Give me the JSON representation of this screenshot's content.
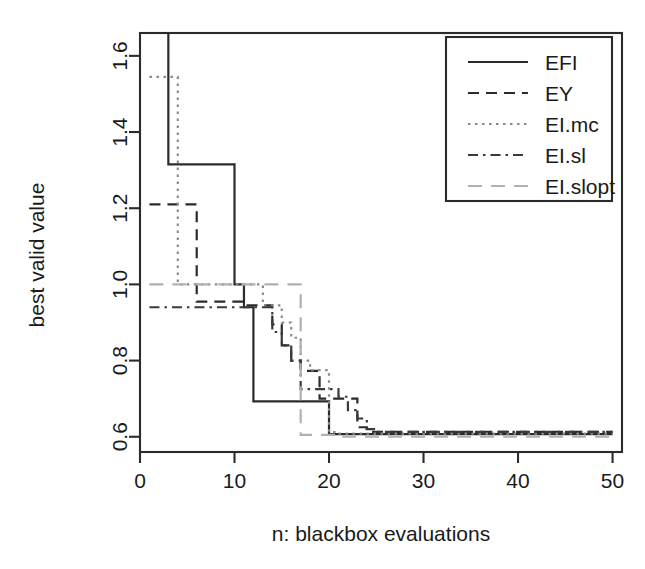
{
  "chart_data": {
    "type": "line",
    "title": "",
    "subtitle": "",
    "xlabel": "n: blackbox evaluations",
    "ylabel": "best valid value",
    "xlim": [
      0,
      51
    ],
    "ylim": [
      0.56,
      1.66
    ],
    "xticks": [
      0,
      10,
      20,
      30,
      40,
      50
    ],
    "xticklabels": [
      "0",
      "10",
      "20",
      "30",
      "40",
      "50"
    ],
    "yticks": [
      0.6,
      0.8,
      1.0,
      1.2,
      1.4,
      1.6
    ],
    "yticklabels": [
      "0.6",
      "0.8",
      "1.0",
      "1.2",
      "1.4",
      "1.6"
    ],
    "grid": false,
    "step": "post",
    "legend_position": "top-right",
    "legend_entries": [
      "EFI",
      "EY",
      "EI.mc",
      "EI.sl",
      "EI.slopt"
    ],
    "series": [
      {
        "name": "EFI",
        "color": "#2b2b2b",
        "linestyle": "solid",
        "dasharray": "",
        "linewidth": 2.2,
        "x": [
          1,
          2,
          3,
          9,
          10,
          11,
          12,
          19,
          20,
          21,
          50
        ],
        "y": [
          1.95,
          1.95,
          1.315,
          1.315,
          1.0,
          0.94,
          0.693,
          0.693,
          0.607,
          0.607,
          0.607
        ]
      },
      {
        "name": "EY",
        "color": "#2b2b2b",
        "linestyle": "dashed",
        "dasharray": "11,7",
        "linewidth": 2.2,
        "x": [
          1,
          4,
          5,
          6,
          11,
          13,
          14,
          15,
          16,
          17,
          18,
          19,
          22,
          23,
          24,
          50
        ],
        "y": [
          1.21,
          1.21,
          1.21,
          0.955,
          0.945,
          0.945,
          0.895,
          0.84,
          0.8,
          0.773,
          0.773,
          0.7,
          0.7,
          0.625,
          0.613,
          0.613
        ]
      },
      {
        "name": "EI.mc",
        "color": "#8a8a8a",
        "linestyle": "dotted",
        "dasharray": "2.5,4.5",
        "linewidth": 2.2,
        "x": [
          1,
          3,
          4,
          11,
          13,
          14,
          15,
          16,
          17,
          18,
          19,
          20,
          21,
          50
        ],
        "y": [
          1.545,
          1.545,
          1.0,
          1.0,
          0.945,
          0.945,
          0.9,
          0.86,
          0.8,
          0.775,
          0.775,
          0.612,
          0.608,
          0.608
        ]
      },
      {
        "name": "EI.sl",
        "color": "#3a3a3a",
        "linestyle": "dashdot",
        "dasharray": "10,5,2.5,5",
        "linewidth": 2.2,
        "x": [
          1,
          12,
          13,
          14,
          15,
          16,
          17,
          18,
          21,
          22,
          23,
          24,
          25,
          50
        ],
        "y": [
          0.94,
          0.94,
          0.94,
          0.875,
          0.84,
          0.8,
          0.725,
          0.725,
          0.705,
          0.67,
          0.648,
          0.62,
          0.613,
          0.613
        ]
      },
      {
        "name": "EI.slopt",
        "color": "#b0b0b0",
        "linestyle": "longdash",
        "dasharray": "14,9",
        "linewidth": 2.2,
        "x": [
          1,
          15,
          16,
          17,
          20,
          21,
          50
        ],
        "y": [
          1.0,
          1.0,
          1.0,
          0.605,
          0.605,
          0.6,
          0.6
        ]
      }
    ]
  },
  "axes": {
    "x_title": "n: blackbox evaluations",
    "y_title": "best valid value"
  },
  "legend": {
    "items": [
      {
        "label": "EFI"
      },
      {
        "label": "EY"
      },
      {
        "label": "EI.mc"
      },
      {
        "label": "EI.sl"
      },
      {
        "label": "EI.slopt"
      }
    ]
  }
}
